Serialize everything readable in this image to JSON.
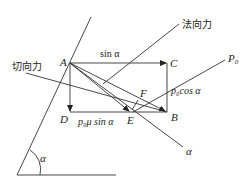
{
  "diagram": {
    "type": "force-decomposition",
    "labels": {
      "normal_force": "法向力",
      "tangential_force": "切向力",
      "sin_top": "sin α",
      "p0cos": "p₀cos α",
      "p0musin": "p₀μ sin α",
      "P0": "P",
      "P0_sub": "0",
      "angle_bottom": "α",
      "angle_ray": "α"
    },
    "points": {
      "A": "A",
      "B": "B",
      "C": "C",
      "D": "D",
      "E": "E",
      "F": "F"
    },
    "colors": {
      "line": "#333333",
      "text": "#222222",
      "background": "#ffffff"
    }
  }
}
